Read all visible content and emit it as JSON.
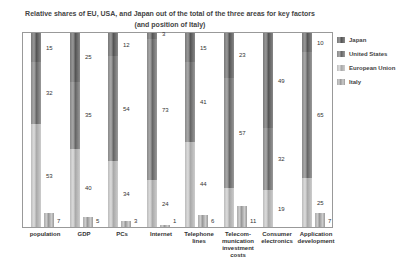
{
  "chart_data": {
    "type": "bar",
    "stacked": true,
    "title": "Relative shares of EU, USA, and Japan out of the total of the three areas for key factors",
    "subtitle": "(and position of Italy)",
    "xlabel": "",
    "ylabel": "",
    "ylim": [
      0,
      100
    ],
    "grid": false,
    "legend_position": "right",
    "categories": [
      "population",
      "GDP",
      "PCs",
      "Internet",
      "Telephone lines",
      "Telecom-munication investment costs",
      "Consumer electronics",
      "Application development"
    ],
    "series": [
      {
        "name": "Japan",
        "values": [
          15,
          25,
          12,
          3,
          15,
          23,
          49,
          10
        ]
      },
      {
        "name": "United States",
        "values": [
          32,
          35,
          54,
          73,
          41,
          57,
          32,
          65
        ]
      },
      {
        "name": "European Union",
        "values": [
          53,
          40,
          34,
          24,
          44,
          20,
          19,
          25
        ]
      },
      {
        "name": "Italy",
        "values": [
          7,
          5,
          3,
          1,
          6,
          11,
          null,
          7
        ]
      }
    ]
  },
  "title": {
    "line1": "Relative shares of EU, USA, and Japan out of the total of the three areas for key factors",
    "line2": "(and position of Italy)"
  },
  "categories": [
    {
      "label": "population",
      "jp": "15",
      "us": "32",
      "eu": "53",
      "it": "7"
    },
    {
      "label": "GDP",
      "jp": "25",
      "us": "35",
      "eu": "40",
      "it": "5"
    },
    {
      "label": "PCs",
      "jp": "12",
      "us": "54",
      "eu": "34",
      "it": "3"
    },
    {
      "label": "Internet",
      "jp": "3",
      "us": "73",
      "eu": "24",
      "it": "1"
    },
    {
      "label": "Telephone lines",
      "jp": "15",
      "us": "41",
      "eu": "44",
      "it": "6"
    },
    {
      "label": "Telecom- munication investment costs",
      "jp": "23",
      "us": "57",
      "eu": "20",
      "it": "11"
    },
    {
      "label": "Consumer electronics",
      "jp": "49",
      "us": "32",
      "eu": "19",
      "it": ""
    },
    {
      "label": "Application development",
      "jp": "10",
      "us": "65",
      "eu": "25",
      "it": "7"
    }
  ],
  "legend": [
    {
      "label": "Japan"
    },
    {
      "label": "United States"
    },
    {
      "label": "European Union"
    },
    {
      "label": "Italy"
    }
  ]
}
